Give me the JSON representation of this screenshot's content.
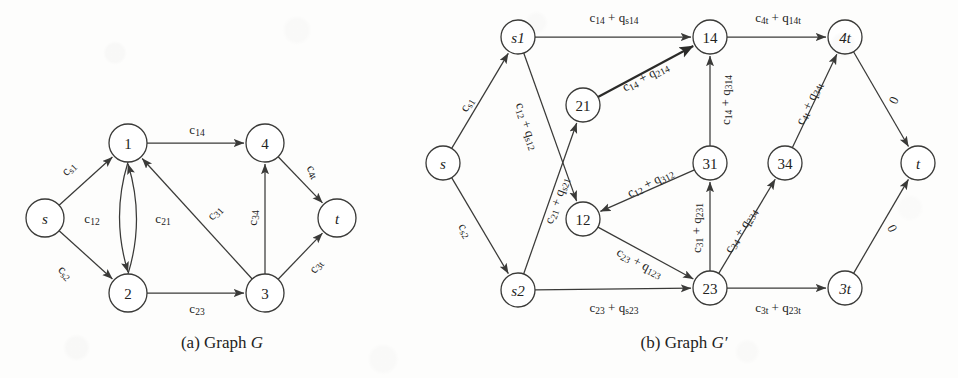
{
  "figure": {
    "caption_a": "(a) Graph ",
    "caption_a_italic": "G",
    "caption_b": "(b) Graph ",
    "caption_b_italic": "G′"
  },
  "graph_a": {
    "nodes": [
      {
        "id": "s",
        "label": "s",
        "italic": true,
        "x": 45,
        "y": 218,
        "r": 19
      },
      {
        "id": "1",
        "label": "1",
        "italic": false,
        "x": 128,
        "y": 143,
        "r": 19
      },
      {
        "id": "2",
        "label": "2",
        "italic": false,
        "x": 128,
        "y": 293,
        "r": 19
      },
      {
        "id": "3",
        "label": "3",
        "italic": false,
        "x": 265,
        "y": 293,
        "r": 19
      },
      {
        "id": "4",
        "label": "4",
        "italic": false,
        "x": 265,
        "y": 143,
        "r": 19
      },
      {
        "id": "t",
        "label": "t",
        "italic": true,
        "x": 337,
        "y": 218,
        "r": 19
      }
    ],
    "edges": [
      {
        "from": "s",
        "to": "1",
        "base": "c",
        "sub": "s1",
        "lx": 68,
        "ly": 168,
        "rot": -45
      },
      {
        "from": "s",
        "to": "2",
        "base": "c",
        "sub": "s2",
        "lx": 66,
        "ly": 272,
        "rot": 45
      },
      {
        "from": "1",
        "to": "2",
        "base": "c",
        "sub": "12",
        "lx": 92,
        "ly": 218,
        "rot": 0,
        "curve": "left"
      },
      {
        "from": "2",
        "to": "1",
        "base": "c",
        "sub": "21",
        "lx": 163,
        "ly": 218,
        "rot": 0,
        "curve": "right"
      },
      {
        "from": "1",
        "to": "4",
        "base": "c",
        "sub": "14",
        "lx": 197,
        "ly": 129,
        "rot": 0
      },
      {
        "from": "3",
        "to": "1",
        "base": "c",
        "sub": "31",
        "lx": 214,
        "ly": 212,
        "rot": -47
      },
      {
        "from": "2",
        "to": "3",
        "base": "c",
        "sub": "23",
        "lx": 197,
        "ly": 308,
        "rot": 0
      },
      {
        "from": "3",
        "to": "4",
        "base": "c",
        "sub": "34",
        "lx": 252,
        "ly": 218,
        "rot": -90
      },
      {
        "from": "4",
        "to": "t",
        "base": "c",
        "sub": "4t",
        "lx": 314,
        "ly": 171,
        "rot": 57
      },
      {
        "from": "3",
        "to": "t",
        "base": "c",
        "sub": "3t",
        "lx": 315,
        "ly": 266,
        "rot": -55
      }
    ]
  },
  "graph_b": {
    "nodes": [
      {
        "id": "s",
        "label": "s",
        "italic": true,
        "x": 443,
        "y": 163,
        "r": 17
      },
      {
        "id": "s1",
        "label": "s1",
        "italic": true,
        "x": 518,
        "y": 37,
        "r": 17
      },
      {
        "id": "s2",
        "label": "s2",
        "italic": true,
        "x": 518,
        "y": 290,
        "r": 17
      },
      {
        "id": "21",
        "label": "21",
        "italic": false,
        "x": 583,
        "y": 105,
        "r": 17
      },
      {
        "id": "12",
        "label": "12",
        "italic": false,
        "x": 583,
        "y": 219,
        "r": 17
      },
      {
        "id": "14",
        "label": "14",
        "italic": false,
        "x": 710,
        "y": 37,
        "r": 17
      },
      {
        "id": "31",
        "label": "31",
        "italic": false,
        "x": 710,
        "y": 163,
        "r": 17
      },
      {
        "id": "23",
        "label": "23",
        "italic": false,
        "x": 710,
        "y": 288,
        "r": 17
      },
      {
        "id": "34",
        "label": "34",
        "italic": false,
        "x": 785,
        "y": 163,
        "r": 17
      },
      {
        "id": "4t",
        "label": "4t",
        "italic": true,
        "x": 845,
        "y": 37,
        "r": 17
      },
      {
        "id": "3t",
        "label": "3t",
        "italic": true,
        "x": 845,
        "y": 288,
        "r": 17
      },
      {
        "id": "t",
        "label": "t",
        "italic": true,
        "x": 918,
        "y": 163,
        "r": 17
      }
    ],
    "edges": [
      {
        "from": "s",
        "to": "s1",
        "text": "c_s1",
        "lx": 466,
        "ly": 104,
        "rot": -58,
        "bold": false
      },
      {
        "from": "s",
        "to": "s2",
        "text": "c_s2",
        "lx": 466,
        "ly": 230,
        "rot": 58,
        "bold": false
      },
      {
        "from": "s1",
        "to": "14",
        "text": "c_14 + q_s14",
        "lx": 614,
        "ly": 17,
        "rot": 0,
        "bold": false
      },
      {
        "from": "s1",
        "to": "12",
        "text": "c_12 + q_s12",
        "lx": 528,
        "ly": 126,
        "rot": 72,
        "bold": false
      },
      {
        "from": "s2",
        "to": "21",
        "text": "c_21 + q_s21",
        "lx": 556,
        "ly": 200,
        "rot": -70,
        "bold": false
      },
      {
        "from": "21",
        "to": "14",
        "text": "c_14 + q_214",
        "lx": 645,
        "ly": 76,
        "rot": -27,
        "bold": true
      },
      {
        "from": "31",
        "to": "14",
        "text": "c_14 + q_314",
        "lx": 725,
        "ly": 100,
        "rot": -90,
        "bold": false
      },
      {
        "from": "14",
        "to": "4t",
        "text": "c_4t + q_14t",
        "lx": 778,
        "ly": 17,
        "rot": 0,
        "bold": false
      },
      {
        "from": "31",
        "to": "12",
        "text": "c_12 + q_312",
        "lx": 650,
        "ly": 182,
        "rot": -27,
        "bold": false
      },
      {
        "from": "23",
        "to": "31",
        "text": "c_31 + q_231",
        "lx": 696,
        "ly": 228,
        "rot": -90,
        "bold": false
      },
      {
        "from": "12",
        "to": "23",
        "text": "c_23 + q_123",
        "lx": 640,
        "ly": 262,
        "rot": 28,
        "bold": false
      },
      {
        "from": "s2",
        "to": "23",
        "text": "c_23 + q_s23",
        "lx": 614,
        "ly": 307,
        "rot": 0,
        "bold": false
      },
      {
        "from": "23",
        "to": "34",
        "text": "c_34 + q_234",
        "lx": 740,
        "ly": 230,
        "rot": -58,
        "bold": false
      },
      {
        "from": "34",
        "to": "4t",
        "text": "c_4t + q_34t",
        "lx": 808,
        "ly": 103,
        "rot": -65,
        "bold": false
      },
      {
        "from": "23",
        "to": "3t",
        "text": "c_3t + q_23t",
        "lx": 778,
        "ly": 307,
        "rot": 0,
        "bold": false
      },
      {
        "from": "4t",
        "to": "t",
        "text": "0",
        "lx": 893,
        "ly": 100,
        "rot": -65,
        "bold": false
      },
      {
        "from": "3t",
        "to": "t",
        "text": "0",
        "lx": 893,
        "ly": 228,
        "rot": 65,
        "bold": false
      }
    ]
  }
}
